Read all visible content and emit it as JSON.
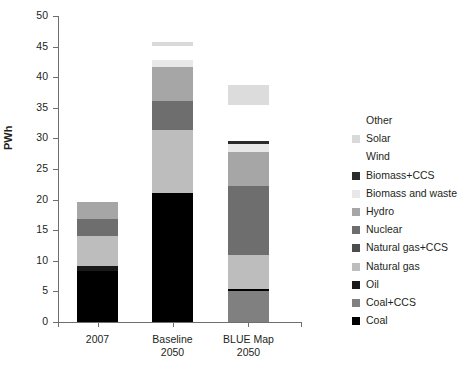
{
  "chart_data": {
    "type": "bar",
    "title": "",
    "xlabel": "",
    "ylabel": "PWh",
    "ylim": [
      0,
      50
    ],
    "yticks": [
      0,
      5,
      10,
      15,
      20,
      25,
      30,
      35,
      40,
      45,
      50
    ],
    "grid": false,
    "stacked": true,
    "legend_position": "right",
    "categories": [
      "2007",
      "Baseline 2050",
      "BLUE Map 2050"
    ],
    "category_lines": [
      [
        "2007"
      ],
      [
        "Baseline",
        "2050"
      ],
      [
        "BLUE Map",
        "2050"
      ]
    ],
    "series": [
      {
        "name": "Coal",
        "color": "#000000",
        "values": [
          8.3,
          21.0,
          0.4
        ]
      },
      {
        "name": "Coal+CCS",
        "color": "#808080",
        "values": [
          0.0,
          0.0,
          5.0
        ]
      },
      {
        "name": "Oil",
        "color": "#1a1a1a",
        "values": [
          0.8,
          0.0,
          0.0
        ]
      },
      {
        "name": "Natural gas",
        "color": "#bdbdbd",
        "values": [
          5.0,
          10.3,
          5.6
        ]
      },
      {
        "name": "Natural gas+CCS",
        "color": "#4d4d4d",
        "values": [
          0.0,
          0.0,
          0.0
        ]
      },
      {
        "name": "Nuclear",
        "color": "#6e6e6e",
        "values": [
          2.8,
          4.8,
          11.3
        ]
      },
      {
        "name": "Hydro",
        "color": "#a6a6a6",
        "values": [
          2.7,
          5.7,
          5.5
        ]
      },
      {
        "name": "Biomass and waste",
        "color": "#e8e8e8",
        "values": [
          0.0,
          1.1,
          1.3
        ]
      },
      {
        "name": "Biomass+CCS",
        "color": "#2b2b2b",
        "values": [
          0.0,
          0.0,
          0.4
        ]
      },
      {
        "name": "Wind",
        "color": "#ffffff",
        "values": [
          0.0,
          0.0,
          3.3
        ]
      },
      {
        "name": "Solar",
        "color": "#d9d9d9",
        "values": [
          0.0,
          0.6,
          0.0
        ]
      },
      {
        "name": "Other",
        "color": "#ffffff",
        "values": [
          0.0,
          2.2,
          2.9
        ]
      }
    ],
    "totals": [
      19.6,
      45.7,
      38.8
    ],
    "annotations": []
  },
  "axis": {
    "y_label": "PWh",
    "y_tick_labels": [
      "0",
      "5",
      "10",
      "15",
      "20",
      "25",
      "30",
      "35",
      "40",
      "45",
      "50"
    ],
    "x_tick_labels": [
      "2007",
      "Baseline 2050",
      "BLUE Map 2050"
    ]
  },
  "legend": {
    "items": [
      {
        "label": "Other",
        "color": "#ffffff",
        "swatch_visible": false
      },
      {
        "label": "Solar",
        "color": "#d9d9d9",
        "swatch_visible": true
      },
      {
        "label": "Wind",
        "color": "#ffffff",
        "swatch_visible": false
      },
      {
        "label": "Biomass+CCS",
        "color": "#2b2b2b",
        "swatch_visible": true
      },
      {
        "label": "Biomass and waste",
        "color": "#e8e8e8",
        "swatch_visible": true
      },
      {
        "label": "Hydro",
        "color": "#a6a6a6",
        "swatch_visible": true
      },
      {
        "label": "Nuclear",
        "color": "#6e6e6e",
        "swatch_visible": true
      },
      {
        "label": "Natural gas+CCS",
        "color": "#4d4d4d",
        "swatch_visible": true
      },
      {
        "label": "Natural gas",
        "color": "#bdbdbd",
        "swatch_visible": true
      },
      {
        "label": "Oil",
        "color": "#1a1a1a",
        "swatch_visible": true
      },
      {
        "label": "Coal+CCS",
        "color": "#808080",
        "swatch_visible": true
      },
      {
        "label": "Coal",
        "color": "#000000",
        "swatch_visible": true
      }
    ]
  },
  "bars": [
    {
      "category": "2007",
      "segments": [
        {
          "name": "Coal",
          "from": 0.0,
          "to": 8.3,
          "color": "#000000"
        },
        {
          "name": "Oil",
          "from": 8.3,
          "to": 9.1,
          "color": "#1a1a1a"
        },
        {
          "name": "Natural gas",
          "from": 9.1,
          "to": 14.1,
          "color": "#bdbdbd"
        },
        {
          "name": "Nuclear",
          "from": 14.1,
          "to": 16.9,
          "color": "#6e6e6e"
        },
        {
          "name": "Hydro",
          "from": 16.9,
          "to": 19.6,
          "color": "#a6a6a6"
        }
      ]
    },
    {
      "category": "Baseline 2050",
      "segments": [
        {
          "name": "Coal",
          "from": 0.0,
          "to": 21.0,
          "color": "#000000"
        },
        {
          "name": "Natural gas",
          "from": 21.0,
          "to": 31.3,
          "color": "#bdbdbd"
        },
        {
          "name": "Nuclear",
          "from": 31.3,
          "to": 36.1,
          "color": "#6e6e6e"
        },
        {
          "name": "Hydro",
          "from": 36.1,
          "to": 41.7,
          "color": "#a6a6a6"
        },
        {
          "name": "Biomass and waste",
          "from": 41.7,
          "to": 42.8,
          "color": "#e8e8e8"
        },
        {
          "name": "Solar",
          "from": 45.1,
          "to": 45.7,
          "color": "#d9d9d9"
        }
      ]
    },
    {
      "category": "BLUE Map 2050",
      "segments": [
        {
          "name": "Coal+CCS",
          "from": 0.0,
          "to": 5.0,
          "color": "#808080"
        },
        {
          "name": "Coal",
          "from": 5.0,
          "to": 5.4,
          "color": "#000000"
        },
        {
          "name": "Natural gas",
          "from": 5.4,
          "to": 11.0,
          "color": "#bdbdbd"
        },
        {
          "name": "Nuclear",
          "from": 11.0,
          "to": 22.3,
          "color": "#6e6e6e"
        },
        {
          "name": "Hydro",
          "from": 22.3,
          "to": 27.8,
          "color": "#a6a6a6"
        },
        {
          "name": "Biomass and waste",
          "from": 27.8,
          "to": 29.1,
          "color": "#e8e8e8"
        },
        {
          "name": "Biomass+CCS",
          "from": 29.1,
          "to": 29.5,
          "color": "#2b2b2b"
        },
        {
          "name": "Wind",
          "from": 35.5,
          "to": 38.8,
          "color": "#dcdcdc"
        }
      ]
    }
  ],
  "geometry": {
    "y_zero_px": 322,
    "px_per_unit": 6.12,
    "bar_width_px": 41,
    "bar_left_px": [
      77,
      152,
      228
    ],
    "tick_x_px": [
      58,
      97.5,
      172.5,
      248,
      301
    ]
  }
}
